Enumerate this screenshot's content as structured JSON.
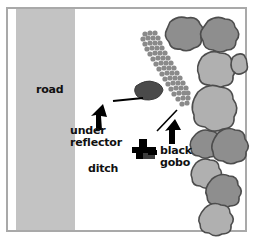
{
  "diagram": {
    "labels": {
      "road": "road",
      "under_reflector": "under\nreflector",
      "ditch": "ditch",
      "black_gobo": "black\ngobo"
    },
    "colors": {
      "frame_border": "#a9a9a9",
      "road_fill": "#c3c3c3",
      "rock_light": "#b0b0b0",
      "rock_dark": "#8e8e8e",
      "rock_outline": "#4d4d4d",
      "reflector_bubble": "#8a8a8a",
      "dark_blob": "#4a4a4a",
      "black": "#000000",
      "background": "#ffffff",
      "text": "#111111"
    },
    "elements": [
      {
        "name": "road-band",
        "kind": "region",
        "label": "road"
      },
      {
        "name": "ditch-area",
        "kind": "region",
        "label": "ditch"
      },
      {
        "name": "reflector-strip",
        "kind": "bubbly-diagonal-band",
        "label": "under reflector"
      },
      {
        "name": "dark-blob",
        "kind": "shape"
      },
      {
        "name": "gobo-stand",
        "kind": "equipment",
        "label": "black gobo"
      },
      {
        "name": "pointer-line-left",
        "kind": "leader-line"
      },
      {
        "name": "pointer-line-right",
        "kind": "leader-line"
      },
      {
        "name": "arrow-under-reflector",
        "kind": "arrow",
        "direction": "up"
      },
      {
        "name": "arrow-black-gobo",
        "kind": "arrow",
        "direction": "up"
      },
      {
        "name": "rock-cluster",
        "kind": "rocks",
        "count": 11
      }
    ]
  }
}
